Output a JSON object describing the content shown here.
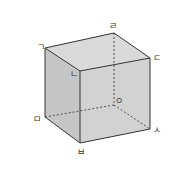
{
  "diagram": {
    "type": "cube",
    "colors": {
      "top_face": "#dadada",
      "left_face": "#c6c6c6",
      "front_face": "#d2d2d2",
      "edge": "#333333",
      "hidden_edge": "#444444",
      "label": "#333333"
    },
    "vertices": [
      {
        "id": "g",
        "label": "ㄱ",
        "x": 45,
        "y": 48,
        "lx": 37,
        "ly": 50
      },
      {
        "id": "n",
        "label": "ㄴ",
        "x": 80,
        "y": 71,
        "lx": 70,
        "ly": 77
      },
      {
        "id": "d",
        "label": "ㄷ",
        "x": 150,
        "y": 58,
        "lx": 153,
        "ly": 61
      },
      {
        "id": "r",
        "label": "ㄹ",
        "x": 114,
        "y": 33,
        "lx": 109,
        "ly": 29
      },
      {
        "id": "m",
        "label": "ㅁ",
        "x": 45,
        "y": 117,
        "lx": 33,
        "ly": 122
      },
      {
        "id": "b",
        "label": "ㅂ",
        "x": 80,
        "y": 143,
        "lx": 77,
        "ly": 155
      },
      {
        "id": "s",
        "label": "ㅅ",
        "x": 150,
        "y": 129,
        "lx": 153,
        "ly": 133
      },
      {
        "id": "o",
        "label": "ㅇ",
        "x": 114,
        "y": 105,
        "lx": 115,
        "ly": 104
      }
    ]
  }
}
